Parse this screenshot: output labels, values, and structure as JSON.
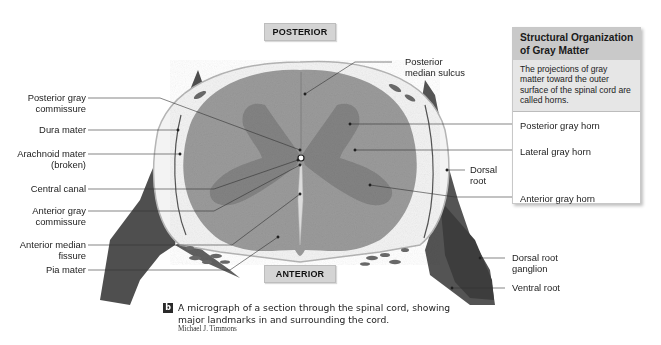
{
  "figure": {
    "orientation_labels": {
      "top": "POSTERIOR",
      "bottom": "ANTERIOR"
    },
    "left_labels": [
      {
        "id": "posterior-gray-commissure",
        "lines": [
          "Posterior gray",
          "commissure"
        ]
      },
      {
        "id": "dura-mater",
        "lines": [
          "Dura mater"
        ]
      },
      {
        "id": "arachnoid-mater",
        "lines": [
          "Arachnoid mater",
          "(broken)"
        ]
      },
      {
        "id": "central-canal",
        "lines": [
          "Central canal"
        ]
      },
      {
        "id": "anterior-gray-commissure",
        "lines": [
          "Anterior gray",
          "commissure"
        ]
      },
      {
        "id": "anterior-median-fissure",
        "lines": [
          "Anterior median",
          "fissure"
        ]
      },
      {
        "id": "pia-mater",
        "lines": [
          "Pia mater"
        ]
      }
    ],
    "top_label": {
      "id": "posterior-median-sulcus",
      "lines": [
        "Posterior",
        "median sulcus"
      ]
    },
    "right_labels": [
      {
        "id": "dorsal-root",
        "lines": [
          "Dorsal",
          "root"
        ]
      },
      {
        "id": "dorsal-root-ganglion",
        "lines": [
          "Dorsal root",
          "ganglion"
        ]
      },
      {
        "id": "ventral-root",
        "lines": [
          "Ventral root"
        ]
      }
    ],
    "info_box": {
      "title": "Structural Organization of Gray Matter",
      "description": "The projections of gray matter toward the outer surface of the spinal cord are called horns.",
      "items": [
        "Posterior gray horn",
        "Lateral gray horn",
        "Anterior gray horn"
      ]
    },
    "caption": {
      "badge": "b",
      "line1": "A micrograph of a section through the spinal cord, showing",
      "line2": "major landmarks in and surrounding the cord.",
      "credit": "Michael J. Timmons"
    }
  },
  "colors": {
    "tag_bg": "#d4d4d4",
    "info_head_bg": "#c9c9c9",
    "info_body_bg": "#e6e6e6",
    "white_matter": "#9a9a9a",
    "gray_matter": "#828282",
    "tissue_dark": "#4e4e4e",
    "leader_line": "#333333"
  }
}
